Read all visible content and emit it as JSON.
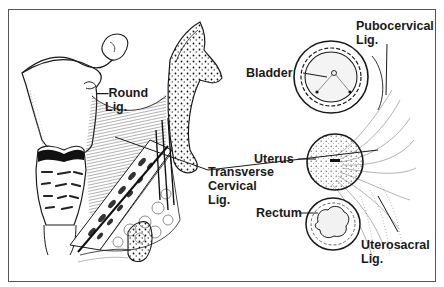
{
  "diagram": {
    "type": "anatomical-illustration",
    "panels": [
      {
        "name": "sagittal-view",
        "structures": [
          "uterus",
          "fallopian-tube",
          "ovary",
          "cervix",
          "pelvic-bone",
          "ligament-fibers"
        ]
      },
      {
        "name": "cross-section-view",
        "structures": [
          "bladder",
          "uterus",
          "rectum",
          "ligament-fibers"
        ]
      }
    ]
  },
  "labels": {
    "round_lig": {
      "line1": "—Round",
      "line2": "Lig."
    },
    "transverse_cervical_lig": {
      "line1": "Transverse",
      "line2": "Cervical",
      "line3": "Lig."
    },
    "pubocervical_lig": {
      "line1": "Pubocervical",
      "line2": "Lig."
    },
    "bladder": "Bladder",
    "uterus": "Uterus",
    "rectum": "Rectum",
    "uterosacral_lig": {
      "line1": "Uterosacral",
      "line2": "Lig."
    }
  },
  "colors": {
    "ink": "#1a1a1a",
    "frame": "#555555",
    "background": "#ffffff"
  }
}
